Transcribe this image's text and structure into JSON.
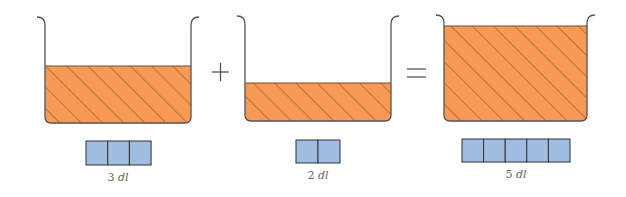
{
  "equation": {
    "operator_plus": "+",
    "operator_equals": "="
  },
  "containers": [
    {
      "name": "container-3dl",
      "amount": 3,
      "unit": "dl",
      "label_num": "3",
      "label_unit": "dl"
    },
    {
      "name": "container-2dl",
      "amount": 2,
      "unit": "dl",
      "label_num": "2",
      "label_unit": "dl"
    },
    {
      "name": "container-5dl",
      "amount": 5,
      "unit": "dl",
      "label_num": "5",
      "label_unit": "dl"
    }
  ],
  "colors": {
    "liquid": "#f79a55",
    "hatch": "#7a4a25",
    "outline": "#555555",
    "block": "#9fbde0",
    "block_border": "#333333"
  }
}
